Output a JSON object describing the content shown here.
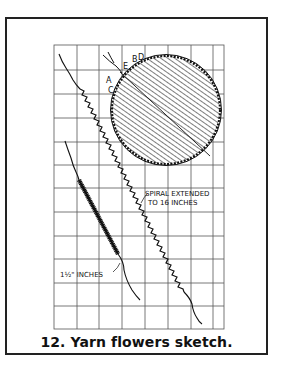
{
  "figure": {
    "caption": "12. Yarn flowers sketch.",
    "labels": {
      "spiral_line1": "SPIRAL EXTENDED",
      "spiral_line2": "TO 16 INCHES",
      "short_coil": "1½\" INCHES",
      "letter_a": "A",
      "letter_b": "B",
      "letter_c": "C",
      "letter_d": "D",
      "letter_e": "E"
    },
    "grid": {
      "columns": 8,
      "rows": 12,
      "line_color": "#555555"
    },
    "colors": {
      "ink": "#111111",
      "paper": "#ffffff",
      "frame": "#222222"
    }
  }
}
